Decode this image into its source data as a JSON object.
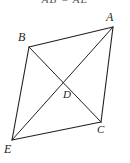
{
  "figure": {
    "type": "geometry-diagram",
    "shape": "quadrilateral-with-diagonals",
    "caption_clipped": "AB = AE",
    "background_color": "#ffffff",
    "stroke_color": "#231f20",
    "stroke_width": 1,
    "label_color": "#231f20",
    "vertices": [
      {
        "name": "A",
        "x": 113,
        "y": 27,
        "label": "A",
        "label_x": 106,
        "label_y": 11
      },
      {
        "name": "B",
        "x": 29,
        "y": 47,
        "label": "B",
        "label_x": 18,
        "label_y": 31
      },
      {
        "name": "C",
        "x": 101,
        "y": 122,
        "label": "C",
        "label_x": 97,
        "label_y": 124
      },
      {
        "name": "E",
        "x": 12,
        "y": 140,
        "label": "E",
        "label_x": 4,
        "label_y": 143
      },
      {
        "name": "D",
        "x": 64,
        "y": 83,
        "label": "D",
        "label_x": 63,
        "label_y": 89
      }
    ],
    "edges": [
      {
        "name": "AB",
        "from": "A",
        "to": "B",
        "kind": "side"
      },
      {
        "name": "BE",
        "from": "B",
        "to": "E",
        "kind": "side"
      },
      {
        "name": "EC",
        "from": "E",
        "to": "C",
        "kind": "side"
      },
      {
        "name": "CA",
        "from": "C",
        "to": "A",
        "kind": "side"
      }
    ],
    "diagonals": [
      {
        "name": "AE",
        "from": "A",
        "to": "E",
        "kind": "diagonal"
      },
      {
        "name": "BC",
        "from": "B",
        "to": "C",
        "kind": "diagonal"
      }
    ],
    "intersection": {
      "name": "D",
      "of": [
        "AE",
        "BC"
      ]
    }
  }
}
